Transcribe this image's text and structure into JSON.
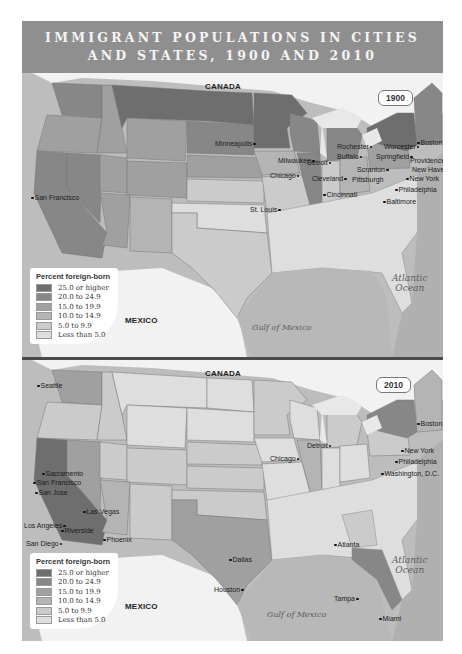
{
  "title": {
    "line1": "IMMIGRANT POPULATIONS IN CITIES",
    "line2": "AND STATES, 1900 AND 2010"
  },
  "legend": {
    "title": "Percent foreign-born",
    "items": [
      {
        "label": "25.0 or higher",
        "color": "#6e6e6e"
      },
      {
        "label": "20.0 to 24.9",
        "color": "#878787"
      },
      {
        "label": "15.0 to 19.9",
        "color": "#a0a0a0"
      },
      {
        "label": "10.0 to 14.9",
        "color": "#b4b4b4"
      },
      {
        "label": "5.0 to 9.9",
        "color": "#cbcbcb"
      },
      {
        "label": "Less than 5.0",
        "color": "#dedede"
      }
    ]
  },
  "labels": {
    "canada": "CANADA",
    "mexico": "MEXICO",
    "gulf": "Gulf of Mexico",
    "atlantic_1": "Atlantic",
    "atlantic_2": "Ocean"
  },
  "map_1900": {
    "year": "1900",
    "cities": [
      "Minneapolis",
      "Milwaukee",
      "Chicago",
      "Detroit",
      "Cleveland",
      "Rochester",
      "Buffalo",
      "Worcester",
      "Boston",
      "Springfield",
      "Providence",
      "New Haven",
      "Scranton",
      "New York",
      "Pittsburgh",
      "Philadelphia",
      "Baltimore",
      "Cincinnati",
      "St. Louis",
      "San Francisco"
    ]
  },
  "map_2010": {
    "year": "2010",
    "cities": [
      "Seattle",
      "Sacramento",
      "San Francisco",
      "San Jose",
      "Las Vegas",
      "Los Angeles",
      "Riverside",
      "San Diego",
      "Phoenix",
      "Chicago",
      "Detroit",
      "Boston",
      "New York",
      "Philadelphia",
      "Washington, D.C.",
      "Atlanta",
      "Dallas",
      "Houston",
      "Tampa",
      "Miami"
    ]
  }
}
